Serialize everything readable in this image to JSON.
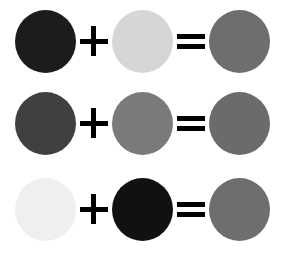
{
  "diagram": {
    "type": "color-mixing-equations",
    "equations": [
      {
        "operands": [
          {
            "color": "#1c1c1c",
            "shade": "near-black"
          },
          {
            "color": "#d6d6d6",
            "shade": "light-gray"
          }
        ],
        "operator": "+",
        "equals": "=",
        "result": {
          "color": "#6e6e6e",
          "shade": "medium-gray"
        }
      },
      {
        "operands": [
          {
            "color": "#404040",
            "shade": "dark-gray"
          },
          {
            "color": "#7a7a7a",
            "shade": "mid-gray"
          }
        ],
        "operator": "+",
        "equals": "=",
        "result": {
          "color": "#6b6b6b",
          "shade": "medium-gray"
        }
      },
      {
        "operands": [
          {
            "color": "#efefef",
            "shade": "near-white"
          },
          {
            "color": "#111111",
            "shade": "black"
          }
        ],
        "operator": "+",
        "equals": "=",
        "result": {
          "color": "#6e6e6e",
          "shade": "medium-gray"
        }
      }
    ]
  }
}
